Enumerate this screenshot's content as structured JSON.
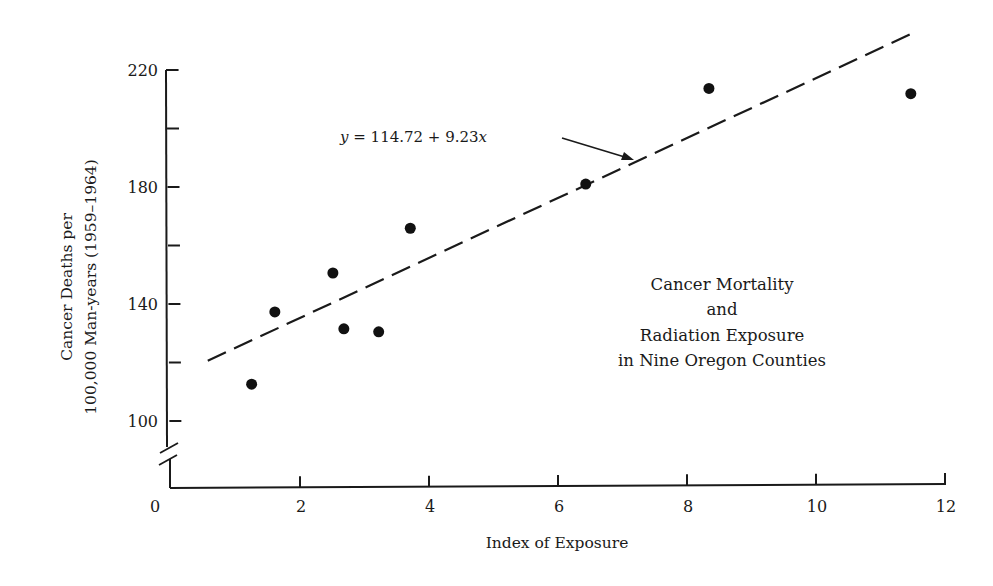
{
  "chart_data": {
    "type": "scatter",
    "title_lines": [
      "Cancer Mortality",
      "and",
      "Radiation Exposure",
      "in Nine Oregon Counties"
    ],
    "xlabel": "Index of Exposure",
    "ylabel": "Cancer Deaths per 100,000 Man-years (1959–1964)",
    "ylabel_lines": [
      "Cancer Deaths per",
      "100,000 Man-years (1959–1964)"
    ],
    "xlim": [
      0,
      12
    ],
    "ylim": [
      100,
      220
    ],
    "y_axis_break": true,
    "grid": false,
    "legend": null,
    "x_ticks": [
      0,
      2,
      4,
      6,
      8,
      10,
      12
    ],
    "x_tick_labels": [
      "0",
      "2",
      "4",
      "6",
      "8",
      "10",
      "12"
    ],
    "y_ticks": [
      100,
      120,
      140,
      160,
      180,
      200,
      220
    ],
    "y_tick_labels": [
      "100",
      "",
      "140",
      "",
      "180",
      "",
      "220"
    ],
    "series": [
      {
        "name": "Counties",
        "marker": "filled-circle",
        "x": [
          1.25,
          1.61,
          2.51,
          2.68,
          3.22,
          3.71,
          6.43,
          8.34,
          11.47
        ],
        "y": [
          112.6,
          137.3,
          150.6,
          131.5,
          130.5,
          165.9,
          181.0,
          213.7,
          211.9
        ]
      }
    ],
    "regression_line": {
      "equation": "y = 114.72 + 9.23x",
      "intercept": 114.72,
      "slope": 9.23,
      "style": "dashed",
      "x_start": 0.57,
      "y_start": 120.6,
      "x_end": 11.5,
      "y_end": 232.6
    },
    "annotation": {
      "text": "y = 114.72 + 9.23x",
      "arrow": true
    }
  }
}
